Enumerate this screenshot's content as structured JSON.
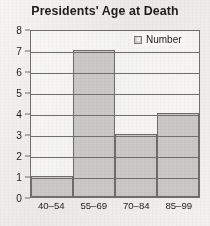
{
  "chart_data": {
    "type": "bar",
    "title": "Presidents' Age at Death",
    "xlabel": "",
    "ylabel": "",
    "categories": [
      "40–54",
      "55–69",
      "70–84",
      "85–99"
    ],
    "values": [
      1,
      7,
      3,
      4
    ],
    "series": [
      {
        "name": "Number",
        "values": [
          1,
          7,
          3,
          4
        ]
      }
    ],
    "ylim": [
      0,
      8
    ],
    "yticks": [
      0,
      1,
      2,
      3,
      4,
      5,
      6,
      7,
      8
    ],
    "ytick_labels": [
      "0",
      "1",
      "2",
      "3",
      "4",
      "5",
      "6",
      "7",
      "8"
    ],
    "grid": true,
    "legend_position": "top-right",
    "legend": [
      "Number"
    ],
    "bar_color": "#c9c8c6",
    "bar_border_color": "#6d6d6d",
    "axis_color": "#6f6f6f",
    "text_color": "#1c1c1c",
    "background": "#ebe9e6"
  },
  "legend": {
    "label": "Number",
    "swatch_name": "legend-color-swatch"
  }
}
